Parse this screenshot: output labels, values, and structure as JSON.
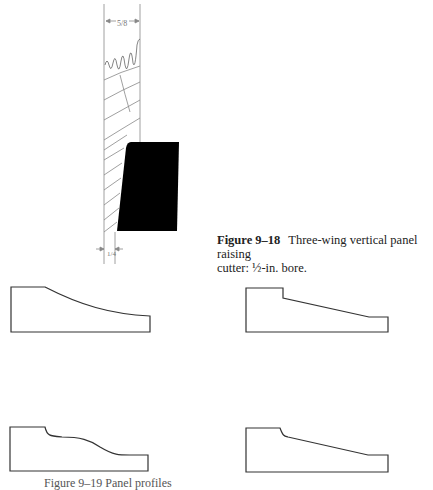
{
  "figure_9_18": {
    "label": "Figure 9–18",
    "title": "Three-wing vertical panel raising",
    "line2": "cutter: ½-in. bore.",
    "dimension_top": "⁵⁄₈\"",
    "dimension_bottom": "¹⁄₄\"",
    "cutter_color": "#000000"
  },
  "profiles": [
    {
      "name": "cove-profile",
      "position": "top-left"
    },
    {
      "name": "stepped-bevel-profile",
      "position": "top-right"
    },
    {
      "name": "ogee-profile",
      "position": "bottom-left"
    },
    {
      "name": "rounded-step-bevel-profile",
      "position": "bottom-right"
    }
  ],
  "bottom_caption": {
    "text": "Figure 9–19   Panel profiles"
  },
  "colors": {
    "line": "#333333",
    "sketch": "#888888",
    "text": "#222222"
  }
}
